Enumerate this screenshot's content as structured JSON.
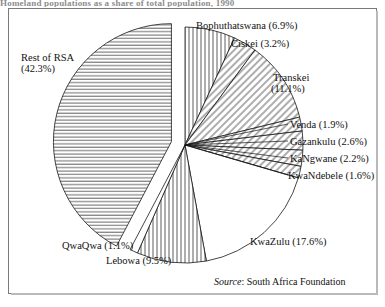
{
  "title_remnant": "Homeland populations as a share of total population, 1990",
  "frame": {
    "border_color": "#7b7b7b",
    "background": "#ffffff"
  },
  "source": {
    "prefix": "Source",
    "separator": ":",
    "text": "South Africa Foundation"
  },
  "chart_data": {
    "type": "pie",
    "title": "",
    "subtitle": "",
    "xlabel": "",
    "ylabel": "",
    "legend_position": "none",
    "grid": false,
    "units": "percent",
    "total": 100.0,
    "note": "Slice labels placed outside the pie; 'Rest of RSA' slice is exploded to the left. All slices rendered white with black hatch patterns.",
    "categories": [
      "Bophuthatswana",
      "Ciskei",
      "Transkei",
      "Venda",
      "Gazankulu",
      "KaNgwane",
      "KwaNdebele",
      "KwaZulu",
      "Lebowa",
      "QwaQwa",
      "Rest of RSA"
    ],
    "values": [
      6.9,
      3.2,
      11.1,
      1.9,
      2.6,
      2.2,
      1.6,
      17.6,
      9.5,
      1.1,
      42.3
    ],
    "slices": [
      {
        "name": "Bophuthatswana",
        "value": 6.9,
        "label": "Bophuthatswana (6.9%)",
        "hatch": "vertical",
        "exploded": false
      },
      {
        "name": "Ciskei",
        "value": 3.2,
        "label": "Ciskei (3.2%)",
        "hatch": "diagonal",
        "exploded": false
      },
      {
        "name": "Transkei",
        "value": 11.1,
        "label_line1": "Transkei",
        "label_line2": "(11.1%)",
        "label": "Transkei (11.1%)",
        "hatch": "diagonal",
        "exploded": false
      },
      {
        "name": "Venda",
        "value": 1.9,
        "label": "Venda (1.9%)",
        "hatch": "diagonal",
        "exploded": false
      },
      {
        "name": "Gazankulu",
        "value": 2.6,
        "label": "Gazankulu (2.6%)",
        "hatch": "diagonal",
        "exploded": false
      },
      {
        "name": "KaNgwane",
        "value": 2.2,
        "label": "KaNgwane (2.2%)",
        "hatch": "diagonal",
        "exploded": false
      },
      {
        "name": "KwaNdebele",
        "value": 1.6,
        "label": "KwaNdebele (1.6%)",
        "hatch": "diagonal",
        "exploded": false
      },
      {
        "name": "KwaZulu",
        "value": 17.6,
        "label": "KwaZulu (17.6%)",
        "hatch": "none",
        "exploded": false
      },
      {
        "name": "Lebowa",
        "value": 9.5,
        "label": "Lebowa (9.5%)",
        "hatch": "vertical",
        "exploded": false
      },
      {
        "name": "QwaQwa",
        "value": 1.1,
        "label": "QwaQwa (1.1%)",
        "hatch": "none",
        "exploded": false
      },
      {
        "name": "Rest of RSA",
        "value": 42.3,
        "label_line1": "Rest of RSA",
        "label_line2": "(42.3%)",
        "label": "Rest of RSA (42.3%)",
        "hatch": "horizontal",
        "exploded": true
      }
    ]
  },
  "labels": {
    "bophuthatswana": "Bophuthatswana (6.9%)",
    "ciskei": "Ciskei (3.2%)",
    "transkei_l1": "Transkei",
    "transkei_l2": "(11.1%)",
    "venda": "Venda (1.9%)",
    "gazankulu": "Gazankulu (2.6%)",
    "kangwane": "KaNgwane (2.2%)",
    "kwandebele": "KwaNdebele (1.6%)",
    "kwazulu": "KwaZulu (17.6%)",
    "lebowa": "Lebowa (9.5%)",
    "qwaqwa": "QwaQwa (1.1%)",
    "rest_l1": "Rest of RSA",
    "rest_l2": "(42.3%)"
  }
}
